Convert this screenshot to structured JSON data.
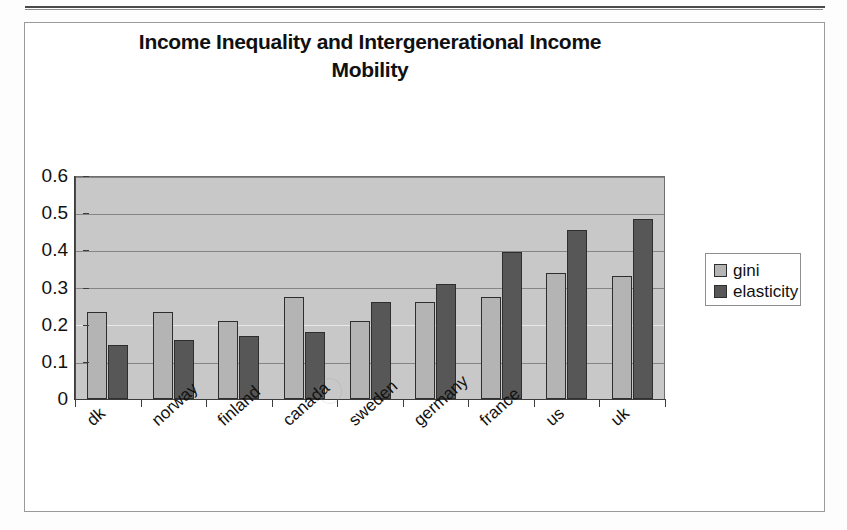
{
  "chart_data": {
    "type": "bar",
    "title": "Income Inequality and Intergenerational Income Mobility",
    "title_line1": "Income Inequality and Intergenerational Income",
    "title_line2": "Mobility",
    "xlabel": "",
    "ylabel": "",
    "ylim": [
      0,
      0.6
    ],
    "ytick_labels": [
      "0.6",
      "0.5",
      "0.4",
      "0.3",
      "0.2",
      "0.1",
      "0"
    ],
    "ytick_values": [
      0.6,
      0.5,
      0.4,
      0.3,
      0.2,
      0.1,
      0
    ],
    "grid": true,
    "legend_position": "right",
    "categories": [
      "dk",
      "norway",
      "finland",
      "canada",
      "sweden",
      "germany",
      "france",
      "us",
      "uk"
    ],
    "series": [
      {
        "name": "gini",
        "color": "#b4b4b4",
        "values": [
          0.235,
          0.235,
          0.21,
          0.275,
          0.21,
          0.26,
          0.275,
          0.34,
          0.33
        ]
      },
      {
        "name": "elasticity",
        "color": "#575757",
        "values": [
          0.145,
          0.16,
          0.17,
          0.18,
          0.26,
          0.31,
          0.395,
          0.455,
          0.485
        ]
      }
    ]
  },
  "legend": {
    "items": [
      {
        "label": "gini",
        "color": "#b4b4b4"
      },
      {
        "label": "elasticity",
        "color": "#575757"
      }
    ]
  },
  "colors": {
    "plot_background": "#c8c8c8",
    "gini": "#b4b4b4",
    "elasticity": "#575757",
    "axis": "#3c3c3c",
    "gridline": "#858585",
    "frame": "#9a9a9a"
  }
}
